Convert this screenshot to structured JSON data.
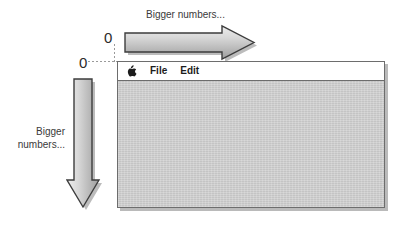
{
  "diagram": {
    "origin_label_horizontal": "0",
    "origin_label_vertical": "0",
    "caption_horizontal": "Bigger numbers...",
    "caption_vertical": "Bigger\nnumbers...",
    "arrow_right_name": "horizontal-axis-arrow",
    "arrow_down_name": "vertical-axis-arrow",
    "colors": {
      "arrow_fill_light": "#e6e6e6",
      "arrow_fill_dark": "#a8a8a8",
      "arrow_outline": "#3d3d3d",
      "arrow_shadow": "#9a9a9a",
      "window_border": "#6d6d6d",
      "menu_bar_bg": "#ffffff",
      "desktop_bg": "#c9c9c9",
      "page_bg": "#ffffff",
      "text": "#2b2b2b",
      "guide_line": "#9a9a9a"
    }
  },
  "window": {
    "menu_bar": {
      "apple_icon": "apple-logo-icon",
      "items": [
        {
          "label": "File"
        },
        {
          "label": "Edit"
        }
      ]
    },
    "desktop": {
      "content": ""
    }
  }
}
